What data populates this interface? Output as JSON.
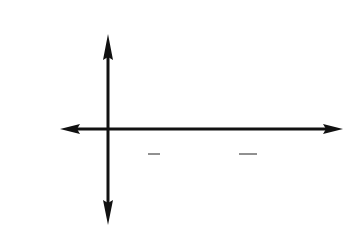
{
  "problem_label": "1d",
  "chart_data": {
    "type": "line",
    "function": "y = cos(2x)",
    "title": "",
    "xlabel": "x",
    "ylabel": "y",
    "x_ticks": [
      {
        "value": 1.5708,
        "label": "π/2"
      },
      {
        "value": 3.1416,
        "label": "π"
      },
      {
        "value": 4.7124,
        "label": "3π/2"
      },
      {
        "value": 6.2832,
        "label": "2π"
      }
    ],
    "y_ticks": [
      {
        "value": 1,
        "label": "1"
      },
      {
        "value": -1,
        "label": "-1"
      }
    ],
    "xlim": [
      -1.5708,
      7.854
    ],
    "ylim": [
      -2,
      2
    ],
    "grid": true,
    "grid_style": "dashed",
    "series": [
      {
        "name": "cos(2x)",
        "x": [
          -0.785,
          0,
          0.785,
          1.571,
          2.356,
          3.142,
          3.927,
          4.712,
          5.498,
          6.283,
          7.069
        ],
        "values": [
          0,
          1,
          0,
          -1,
          0,
          1,
          0,
          -1,
          0,
          1,
          0
        ]
      }
    ],
    "colors": {
      "curve": "#444444",
      "axes": "#111111",
      "grid": "#888888"
    }
  },
  "labels": {
    "x_axis": "x",
    "y_axis": "y",
    "tick_one": "1",
    "tick_neg_one": "-1",
    "pi": "π",
    "two_pi": "2π",
    "pi_num": "π",
    "den_2": "2",
    "three_pi_num": "3π",
    "den_2b": "2"
  }
}
